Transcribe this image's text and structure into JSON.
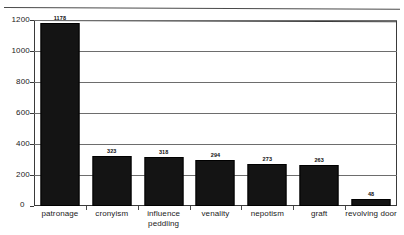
{
  "chart_data": {
    "type": "bar",
    "title": "",
    "xlabel": "",
    "ylabel": "",
    "categories": [
      "patronage",
      "cronyism",
      "influence peddling",
      "venality",
      "nepotism",
      "graft",
      "revolving door"
    ],
    "values": [
      1178,
      323,
      318,
      294,
      273,
      263,
      48
    ],
    "value_labels": [
      "1178",
      "323",
      "318",
      "294",
      "273",
      "263",
      "48"
    ],
    "ylim": [
      0,
      1200
    ],
    "yticks": [
      0,
      200,
      400,
      600,
      800,
      1000,
      1200
    ],
    "ytick_labels": [
      "0",
      "200",
      "400",
      "600",
      "800",
      "1000",
      "1200"
    ],
    "grid": true,
    "legend": "none",
    "bar_color": "#141414",
    "gridline_color": "#6d6d6d",
    "axis_color": "#3a3a3a"
  }
}
